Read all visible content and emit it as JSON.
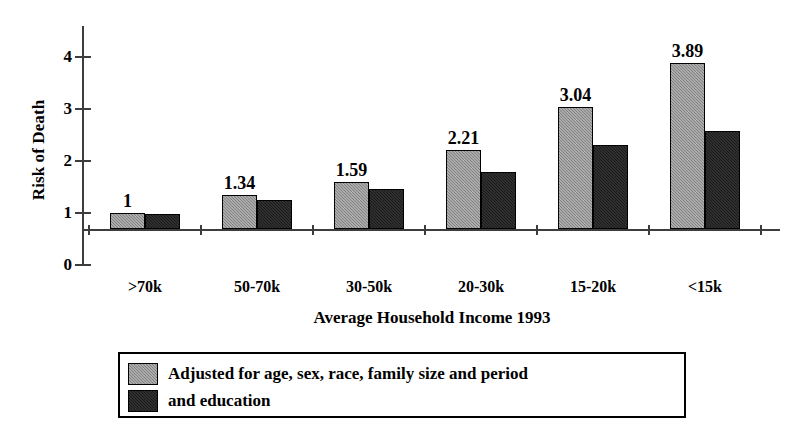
{
  "chart_data": {
    "type": "bar",
    "title": "",
    "xlabel": "Average Household Income 1993",
    "ylabel": "Risk of Death",
    "categories": [
      ">70k",
      "50-70k",
      "30-50k",
      "20-30k",
      "15-20k",
      "<15k"
    ],
    "series": [
      {
        "name": "Adjusted for age, sex, race, family size and period",
        "color": "#808080",
        "values": [
          1,
          1.34,
          1.59,
          2.21,
          3.04,
          3.89
        ],
        "data_labels": [
          "1",
          "1.34",
          "1.59",
          "2.21",
          "3.04",
          "3.89"
        ]
      },
      {
        "name": "and education",
        "color": "#191919",
        "values": [
          0.98,
          1.25,
          1.46,
          1.79,
          2.31,
          2.58
        ],
        "data_labels": [
          "",
          "",
          "",
          "",
          "",
          ""
        ]
      }
    ],
    "ylim": [
      0,
      4
    ],
    "yticks": [
      0,
      1,
      2,
      3,
      4
    ],
    "ytick_labels": [
      "0",
      "1",
      "2",
      "3",
      "4"
    ],
    "baseline_value": 0.69,
    "grid": false,
    "legend_position": "bottom"
  },
  "axes": {
    "y_title": "Risk of Death",
    "x_title": "Average Household Income 1993"
  },
  "legend": {
    "entries": [
      {
        "label": "Adjusted for age, sex, race, family size and period",
        "swatch": "grey"
      },
      {
        "label": "and education",
        "swatch": "black"
      }
    ]
  }
}
